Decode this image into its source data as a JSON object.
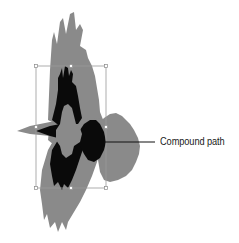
{
  "figure": {
    "callout": {
      "label": "Compound path"
    }
  },
  "colors": {
    "background": "#ffffff",
    "outer_shape": "#8a8a8a",
    "compound_path": "#0a0a0a",
    "inner_hole": "#8a8a8a",
    "bounding_box": "#9a9a9a",
    "callout_line": "#111111"
  },
  "selection": {
    "bounding_box": {
      "x": 36,
      "y": 66,
      "width": 70,
      "height": 122
    },
    "handles": [
      "top-left",
      "top-middle",
      "top-right",
      "middle-left",
      "middle-right",
      "bottom-left",
      "bottom-middle",
      "bottom-right"
    ]
  }
}
